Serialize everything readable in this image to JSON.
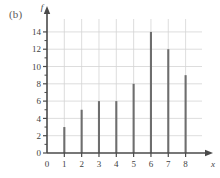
{
  "figure": {
    "panel_label": "(b)",
    "background_color": "#ffffff"
  },
  "chart_data": {
    "type": "bar",
    "title": "",
    "xlabel": "x",
    "ylabel": "f",
    "categories": [
      "1",
      "2",
      "3",
      "4",
      "5",
      "6",
      "7",
      "8"
    ],
    "x": [
      1,
      2,
      3,
      4,
      5,
      6,
      7,
      8
    ],
    "values": [
      3,
      5,
      6,
      6,
      8,
      14,
      12,
      9
    ],
    "xlim": [
      0,
      8.6
    ],
    "ylim": [
      0,
      14.8
    ],
    "xticks": [
      0,
      1,
      2,
      3,
      4,
      5,
      6,
      7,
      8
    ],
    "xtick_labels": [
      "0",
      "1",
      "2",
      "3",
      "4",
      "5",
      "6",
      "7",
      "8"
    ],
    "yticks": [
      0,
      2,
      4,
      6,
      8,
      10,
      12,
      14
    ],
    "ytick_labels": [
      "0",
      "2",
      "4",
      "6",
      "8",
      "10",
      "12",
      "14"
    ],
    "y_minor_ticks": [
      1,
      3,
      5,
      7,
      9,
      11,
      13
    ],
    "grid": true,
    "grid_color": "#d4d4d4",
    "bar_color": "#6e6e6e",
    "axis_color": "#4a4a4a",
    "legend": null,
    "bar_style": "spike"
  }
}
